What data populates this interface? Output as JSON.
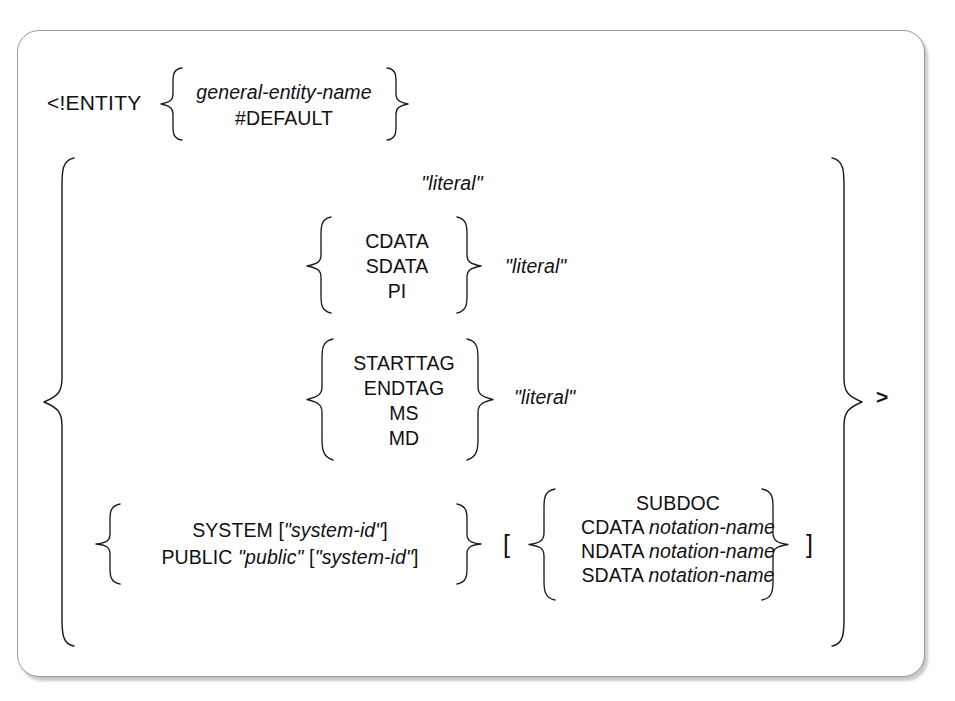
{
  "diagram": {
    "type": "syntax-railroad-diagram",
    "keyword": "<!ENTITY",
    "terminator": ">",
    "colors": {
      "ink": "#1d1d1d",
      "frame": "#9a9a9a",
      "background": "#ffffff"
    },
    "name_group": {
      "options": [
        {
          "text": "general-entity-name",
          "style": "italic"
        },
        {
          "text": "#DEFAULT",
          "style": "roman"
        }
      ]
    },
    "value_alternatives": [
      {
        "id": "plain-literal",
        "literal": "\"literal\""
      },
      {
        "id": "data-text",
        "options": [
          "CDATA",
          "SDATA",
          "PI"
        ],
        "literal": "\"literal\""
      },
      {
        "id": "bracketed-text",
        "options": [
          "STARTTAG",
          "ENDTAG",
          "MS",
          "MD"
        ],
        "literal": "\"literal\""
      },
      {
        "id": "external-identifier",
        "external_options": [
          {
            "parts": [
              {
                "text": "SYSTEM ",
                "style": "roman"
              },
              {
                "text": "[",
                "style": "roman"
              },
              {
                "text": "\"system-id\"",
                "style": "italic"
              },
              {
                "text": "]",
                "style": "roman"
              }
            ]
          },
          {
            "parts": [
              {
                "text": "PUBLIC ",
                "style": "roman"
              },
              {
                "text": "\"public\"",
                "style": "italic"
              },
              {
                "text": "  [",
                "style": "roman"
              },
              {
                "text": "\"system-id\"",
                "style": "italic"
              },
              {
                "text": "]",
                "style": "roman"
              }
            ]
          }
        ],
        "open_bracket": "[",
        "close_bracket": "]",
        "data_type_options": [
          {
            "parts": [
              {
                "text": "SUBDOC",
                "style": "roman"
              }
            ]
          },
          {
            "parts": [
              {
                "text": "CDATA ",
                "style": "roman"
              },
              {
                "text": "notation-name",
                "style": "italic"
              }
            ]
          },
          {
            "parts": [
              {
                "text": "NDATA ",
                "style": "roman"
              },
              {
                "text": "notation-name",
                "style": "italic"
              }
            ]
          },
          {
            "parts": [
              {
                "text": "SDATA ",
                "style": "roman"
              },
              {
                "text": "notation-name",
                "style": "italic"
              }
            ]
          }
        ]
      }
    ]
  }
}
